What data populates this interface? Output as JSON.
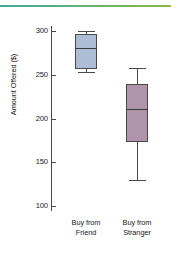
{
  "chart_data": {
    "type": "box",
    "title": "",
    "xlabel": "",
    "ylabel": "Amount Offered ($)",
    "ylim": [
      90,
      310
    ],
    "yticks": [
      100,
      150,
      200,
      250,
      300
    ],
    "ytick_labels": [
      "100",
      "150",
      "200",
      "250",
      "300"
    ],
    "grid": false,
    "legend": "none",
    "categories": [
      "Buy from Friend",
      "Buy from Stranger"
    ],
    "category_lines": [
      [
        "Buy from",
        "Friend"
      ],
      [
        "Buy from",
        "Stranger"
      ]
    ],
    "boxes": [
      {
        "name": "Buy from Friend",
        "whisker_low": 253,
        "q1": 257,
        "median": 281,
        "q3": 297,
        "whisker_high": 300,
        "fill": "#aebdd6",
        "edge": "#4a4a4a"
      },
      {
        "name": "Buy from Stranger",
        "whisker_low": 130,
        "q1": 173,
        "median": 211,
        "q3": 240,
        "whisker_high": 258,
        "fill": "#b094ab",
        "edge": "#4a4a4a"
      }
    ]
  },
  "decoration": {
    "top_rule_colors": [
      "#3fa8a0",
      "#8cbb46"
    ]
  }
}
